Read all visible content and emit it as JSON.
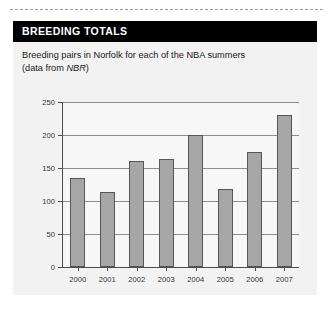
{
  "panel": {
    "header_title": "BREEDING TOTALS",
    "caption_line1": "Breeding pairs in Norfolk for each of the NBA summers",
    "caption_line2_prefix": "(data from ",
    "caption_source": "NBR",
    "caption_line2_suffix": ")"
  },
  "chart_data": {
    "type": "bar",
    "title": "BREEDING TOTALS",
    "subtitle": "Breeding pairs in Norfolk for each of the NBA summers (data from NBR)",
    "categories": [
      "2000",
      "2001",
      "2002",
      "2003",
      "2004",
      "2005",
      "2006",
      "2007"
    ],
    "values": [
      135,
      113,
      160,
      164,
      200,
      118,
      175,
      230
    ],
    "xlabel": "",
    "ylabel": "",
    "ylim": [
      0,
      250
    ],
    "yticks": [
      0,
      50,
      100,
      150,
      200,
      250
    ],
    "ytick_labels": [
      "0",
      "50",
      "100",
      "150",
      "200",
      "250"
    ],
    "grid": true,
    "legend": false,
    "bar_color": "#a6a6a6",
    "bar_edge_color": "#575757"
  },
  "colors": {
    "header_bg": "#000000",
    "header_text": "#ffffff",
    "panel_bg": "#f2f2f2",
    "plot_bg": "#f7f7f7",
    "axis": "#4d4d4d",
    "gridline": "#8c8c8c"
  }
}
